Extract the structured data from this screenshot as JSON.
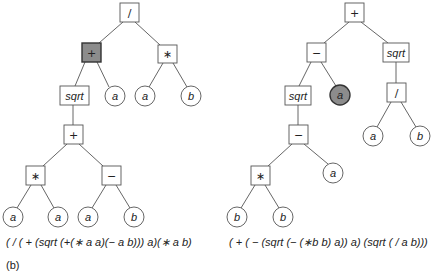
{
  "figure_label": "(b)",
  "colors": {
    "highlight": "#8c8c8c",
    "stroke": "#555555",
    "background": "#ffffff"
  },
  "left_tree": {
    "expression": "( / ( + (sqrt (+(∗ a a)(− a b))) a)(∗ a b)",
    "nodes": {
      "root": "/",
      "plus_hl": "+",
      "mul_top": "∗",
      "sqrt": "sqrt",
      "a1": "a",
      "a2": "a",
      "b1": "b",
      "plus_low": "+",
      "mul_low": "∗",
      "minus": "−",
      "a3": "a",
      "a4": "a",
      "a5": "a",
      "b2": "b"
    },
    "highlighted": "plus_hl"
  },
  "right_tree": {
    "expression": "( + ( − (sqrt (− (∗b b) a)) a) (sqrt ( / a b)))",
    "nodes": {
      "root": "+",
      "minus_top": "−",
      "sqrt_right": "sqrt",
      "sqrt_left": "sqrt",
      "a_hl": "a",
      "div": "/",
      "a1": "a",
      "b1": "b",
      "minus_low": "−",
      "mul": "∗",
      "a2": "a",
      "b2": "b",
      "b3": "b"
    },
    "highlighted": "a_hl"
  }
}
